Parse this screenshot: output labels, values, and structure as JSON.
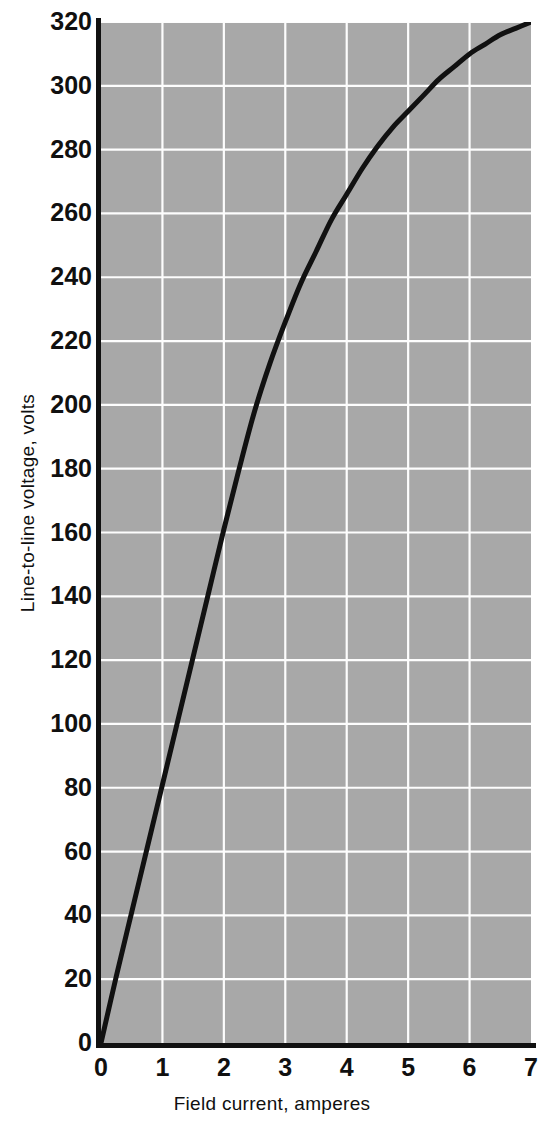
{
  "chart_data": {
    "type": "line",
    "title": "",
    "subtitle": "",
    "xlabel": "Field current, amperes",
    "ylabel": "Line-to-line voltage, volts",
    "xlim": [
      0,
      7
    ],
    "ylim": [
      0,
      320
    ],
    "xticks": [
      "0",
      "1",
      "2",
      "3",
      "4",
      "5",
      "6",
      "7"
    ],
    "xtick_values": [
      0,
      1,
      2,
      3,
      4,
      5,
      6,
      7
    ],
    "yticks": [
      "0",
      "20",
      "40",
      "60",
      "80",
      "100",
      "120",
      "140",
      "160",
      "180",
      "200",
      "220",
      "240",
      "260",
      "280",
      "300",
      "320"
    ],
    "ytick_values": [
      0,
      20,
      40,
      60,
      80,
      100,
      120,
      140,
      160,
      180,
      200,
      220,
      240,
      260,
      280,
      300,
      320
    ],
    "grid": true,
    "grid_color": "#fdfdfd",
    "plot_background": "#a8a8a8",
    "legend": null,
    "legend_position": "none",
    "series": [
      {
        "name": "Open-circuit saturation curve",
        "color": "#111111",
        "linewidth": 5,
        "x": [
          0.0,
          0.25,
          0.5,
          0.75,
          1.0,
          1.25,
          1.5,
          1.75,
          2.0,
          2.25,
          2.5,
          2.75,
          3.0,
          3.25,
          3.5,
          3.75,
          4.0,
          4.25,
          4.5,
          4.75,
          5.0,
          5.25,
          5.5,
          5.75,
          6.0,
          6.25,
          6.5,
          6.75,
          7.0
        ],
        "y": [
          0,
          21,
          41,
          61,
          81,
          101,
          121,
          141,
          161,
          180,
          198,
          213,
          226,
          238,
          248,
          258,
          266,
          274,
          281,
          287,
          292,
          297,
          302,
          306,
          310,
          313,
          316,
          318,
          320
        ]
      }
    ],
    "annotations": []
  }
}
